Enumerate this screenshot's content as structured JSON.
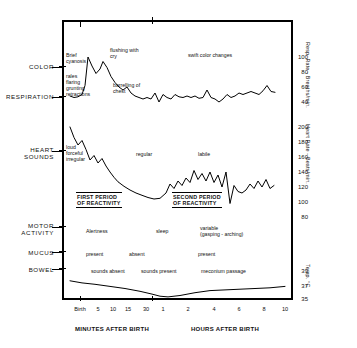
{
  "header": {
    "line1": "SD  1084",
    "line2": "APGAR  9",
    "line3": "BIRTH WEIGHT: 3586 GMS."
  },
  "row_labels": {
    "color": "COLOR",
    "respiration": "RESPIRATION",
    "heart_sounds": "HEART\nSOUNDS",
    "motor_activity": "MOTOR\nACTIVITY",
    "mucus": "MUCUS",
    "bowel": "BOWEL"
  },
  "periods": {
    "first": "FIRST PERIOD\nOF REACTIVITY",
    "second": "SECOND PERIOD\nOF REACTIVITY"
  },
  "annotations": {
    "color": [
      {
        "text": "Brief\ncyanosis",
        "x": 66,
        "y": 52
      },
      {
        "text": "flushing with\ncry",
        "x": 110,
        "y": 47
      },
      {
        "text": "swift color changes",
        "x": 188,
        "y": 52
      }
    ],
    "respiration": [
      {
        "text": "rales\nflaring\ngrunting\nretractions",
        "x": 66,
        "y": 73
      },
      {
        "text": "barrelling of\nchest",
        "x": 113,
        "y": 82
      }
    ],
    "heart": [
      {
        "text": "loud\nforceful\nirregular",
        "x": 66,
        "y": 144
      },
      {
        "text": "regular",
        "x": 136,
        "y": 151
      },
      {
        "text": "labile",
        "x": 198,
        "y": 151
      }
    ],
    "motor": [
      {
        "text": "Alertness",
        "x": 86,
        "y": 228
      },
      {
        "text": "sleep",
        "x": 156,
        "y": 228
      },
      {
        "text": "variable\n(gasping - arching)",
        "x": 200,
        "y": 225
      }
    ],
    "mucus": [
      {
        "text": "present",
        "x": 86,
        "y": 251
      },
      {
        "text": "absent",
        "x": 129,
        "y": 251
      },
      {
        "text": "present",
        "x": 198,
        "y": 251
      }
    ],
    "bowel": [
      {
        "text": "sounds absent",
        "x": 91,
        "y": 268
      },
      {
        "text": "sounds present",
        "x": 141,
        "y": 268
      },
      {
        "text": "meconium passage",
        "x": 201,
        "y": 268
      }
    ]
  },
  "axes": {
    "respiration": {
      "title": "Resp. Rate - Breaths/min.",
      "ticks": [
        "100",
        "80",
        "60",
        "40"
      ],
      "tick_y": [
        57,
        72,
        87,
        102
      ]
    },
    "heart": {
      "title": "Heart Rate - Beats/min.",
      "ticks": [
        "200",
        "180",
        "160",
        "140",
        "120",
        "100",
        "80"
      ],
      "tick_y": [
        127,
        142,
        157,
        172,
        187,
        202,
        217
      ]
    },
    "temperature": {
      "title": "Temp. °C",
      "ticks": [
        "39",
        "37",
        "35"
      ],
      "tick_y": [
        271,
        286,
        299
      ]
    },
    "x_minutes": {
      "group_label": "MINUTES AFTER BIRTH",
      "ticks": [
        "Birth",
        "5",
        "10",
        "15",
        "30"
      ]
    },
    "x_hours": {
      "group_label": "HOURS AFTER BIRTH",
      "ticks": [
        "1",
        "2",
        "4",
        "6",
        "8",
        "10"
      ]
    }
  },
  "chart_data": {
    "type": "line",
    "xlabel": "Time after birth (minutes then hours)",
    "grid": false,
    "legend": "none",
    "x_axis": {
      "segments": [
        {
          "label": "MINUTES AFTER BIRTH",
          "ticks": [
            "Birth",
            "5",
            "10",
            "15",
            "30"
          ]
        },
        {
          "label": "HOURS AFTER BIRTH",
          "ticks": [
            "1",
            "2",
            "4",
            "6",
            "8",
            "10"
          ]
        }
      ]
    },
    "series": [
      {
        "name": "Respiratory Rate",
        "ylabel": "Resp. Rate - Breaths/min.",
        "ylim": [
          30,
          110
        ],
        "points": [
          [
            70,
            48
          ],
          [
            74,
            46
          ],
          [
            78,
            47
          ],
          [
            82,
            50
          ],
          [
            85,
            62
          ],
          [
            88,
            100
          ],
          [
            92,
            88
          ],
          [
            96,
            78
          ],
          [
            100,
            84
          ],
          [
            103,
            94
          ],
          [
            107,
            86
          ],
          [
            111,
            74
          ],
          [
            115,
            66
          ],
          [
            119,
            60
          ],
          [
            123,
            56
          ],
          [
            127,
            60
          ],
          [
            131,
            52
          ],
          [
            135,
            48
          ],
          [
            139,
            46
          ],
          [
            143,
            44
          ],
          [
            147,
            46
          ],
          [
            151,
            44
          ],
          [
            155,
            52
          ],
          [
            159,
            40
          ],
          [
            163,
            50
          ],
          [
            167,
            46
          ],
          [
            171,
            44
          ],
          [
            175,
            50
          ],
          [
            179,
            47
          ],
          [
            183,
            46
          ],
          [
            187,
            48
          ],
          [
            191,
            46
          ],
          [
            195,
            48
          ],
          [
            199,
            45
          ],
          [
            203,
            46
          ],
          [
            207,
            56
          ],
          [
            211,
            46
          ],
          [
            215,
            44
          ],
          [
            219,
            40
          ],
          [
            223,
            44
          ],
          [
            227,
            50
          ],
          [
            231,
            46
          ],
          [
            235,
            48
          ],
          [
            239,
            52
          ],
          [
            243,
            50
          ],
          [
            247,
            52
          ],
          [
            251,
            54
          ],
          [
            255,
            52
          ],
          [
            259,
            50
          ],
          [
            263,
            55
          ],
          [
            267,
            62
          ],
          [
            271,
            54
          ],
          [
            275,
            53
          ]
        ]
      },
      {
        "name": "Heart Rate",
        "ylabel": "Heart Rate - Beats/min.",
        "ylim": [
          80,
          200
        ],
        "points": [
          [
            70,
            200
          ],
          [
            74,
            186
          ],
          [
            78,
            176
          ],
          [
            82,
            182
          ],
          [
            86,
            170
          ],
          [
            90,
            156
          ],
          [
            94,
            162
          ],
          [
            98,
            152
          ],
          [
            102,
            158
          ],
          [
            106,
            148
          ],
          [
            110,
            140
          ],
          [
            114,
            133
          ],
          [
            118,
            127
          ],
          [
            124,
            121
          ],
          [
            130,
            116
          ],
          [
            136,
            112
          ],
          [
            142,
            109
          ],
          [
            148,
            106
          ],
          [
            154,
            104
          ],
          [
            160,
            105
          ],
          [
            166,
            112
          ],
          [
            170,
            124
          ],
          [
            174,
            118
          ],
          [
            178,
            128
          ],
          [
            182,
            122
          ],
          [
            186,
            132
          ],
          [
            190,
            126
          ],
          [
            194,
            142
          ],
          [
            198,
            130
          ],
          [
            202,
            138
          ],
          [
            206,
            128
          ],
          [
            210,
            140
          ],
          [
            214,
            126
          ],
          [
            218,
            136
          ],
          [
            222,
            120
          ],
          [
            226,
            140
          ],
          [
            230,
            98
          ],
          [
            234,
            122
          ],
          [
            238,
            114
          ],
          [
            242,
            112
          ],
          [
            246,
            116
          ],
          [
            250,
            124
          ],
          [
            254,
            118
          ],
          [
            258,
            128
          ],
          [
            262,
            120
          ],
          [
            266,
            130
          ],
          [
            270,
            118
          ],
          [
            274,
            122
          ]
        ]
      },
      {
        "name": "Temperature",
        "ylabel": "Temp. °C",
        "ylim": [
          35,
          39
        ],
        "points": [
          [
            70,
            37.6
          ],
          [
            82,
            37.3
          ],
          [
            95,
            37.1
          ],
          [
            110,
            36.8
          ],
          [
            125,
            36.5
          ],
          [
            140,
            36.1
          ],
          [
            152,
            35.7
          ],
          [
            160,
            35.4
          ],
          [
            168,
            35.3
          ],
          [
            180,
            35.5
          ],
          [
            195,
            35.9
          ],
          [
            210,
            36.2
          ],
          [
            225,
            36.3
          ],
          [
            240,
            36.4
          ],
          [
            255,
            36.5
          ],
          [
            270,
            36.6
          ],
          [
            285,
            36.8
          ]
        ]
      }
    ]
  }
}
